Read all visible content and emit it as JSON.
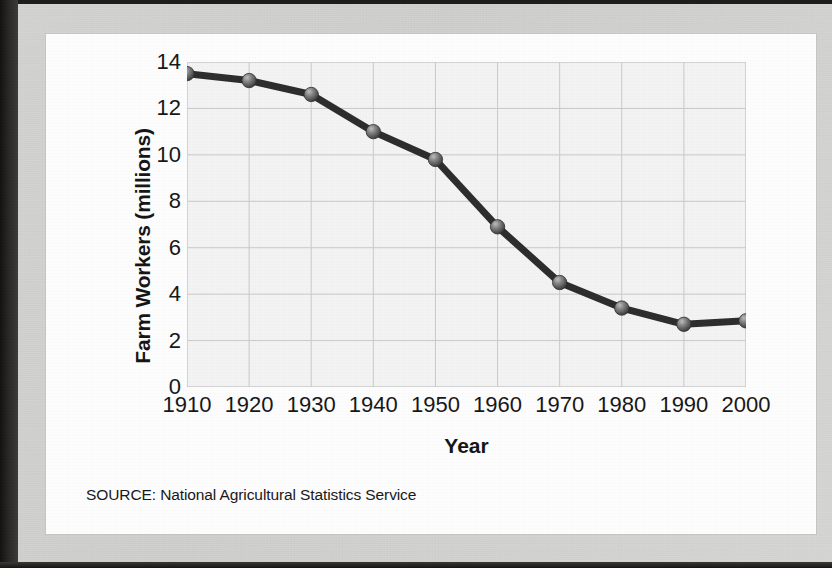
{
  "figure": {
    "source_note": "SOURCE: National Agricultural Statistics Service"
  },
  "chart_data": {
    "type": "line",
    "title": "",
    "xlabel": "Year",
    "ylabel": "Farm Workers (millions)",
    "categories": [
      "1910",
      "1920",
      "1930",
      "1940",
      "1950",
      "1960",
      "1970",
      "1980",
      "1990",
      "2000"
    ],
    "x": [
      1910,
      1920,
      1930,
      1940,
      1950,
      1960,
      1970,
      1980,
      1990,
      2000
    ],
    "values": [
      13.5,
      13.2,
      12.6,
      11.0,
      9.8,
      6.9,
      4.5,
      3.4,
      2.7,
      2.85
    ],
    "series": [
      {
        "name": "Farm Workers",
        "values": [
          13.5,
          13.2,
          12.6,
          11.0,
          9.8,
          6.9,
          4.5,
          3.4,
          2.7,
          2.85
        ]
      }
    ],
    "xlim": [
      1910,
      2000
    ],
    "ylim": [
      0,
      14
    ],
    "ytick_labels": [
      "0",
      "2",
      "4",
      "6",
      "8",
      "10",
      "12",
      "14"
    ],
    "yticks": [
      0,
      2,
      4,
      6,
      8,
      10,
      12,
      14
    ],
    "xtick_labels": [
      "1910",
      "1920",
      "1930",
      "1940",
      "1950",
      "1960",
      "1970",
      "1980",
      "1990",
      "2000"
    ],
    "grid": true,
    "legend": "none",
    "marker": "circle",
    "line_color": "#2c2c2c",
    "marker_color": "#6e6e6e",
    "plot_bg_color": "#f3f3f3",
    "grid_color": "#c9c9c9"
  }
}
